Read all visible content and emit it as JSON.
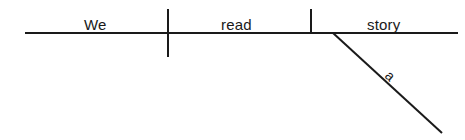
{
  "diagram": {
    "type": "reed-kellogg-sentence-diagram",
    "sentence": "We read a story",
    "canvas": {
      "width": 465,
      "height": 140,
      "background": "#ffffff"
    },
    "stroke_color": "#1a1a1a",
    "stroke_width": 2,
    "baseline": {
      "x1": 25,
      "y1": 33,
      "x2": 458,
      "y2": 33
    },
    "dividers": [
      {
        "role": "subject-verb-divider",
        "x": 168,
        "y1": 9,
        "y2": 57,
        "crosses_baseline": true
      },
      {
        "role": "verb-object-divider",
        "x": 311,
        "y1": 9,
        "y2": 34,
        "crosses_baseline": false
      }
    ],
    "modifier_line": {
      "role": "article-modifier-slant",
      "x1": 333,
      "y1": 33,
      "x2": 442,
      "y2": 133
    },
    "words": {
      "subject": "We",
      "verb": "read",
      "direct_object": "story",
      "modifier": "a"
    }
  }
}
